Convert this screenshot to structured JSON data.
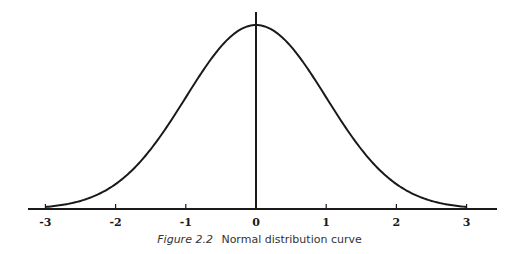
{
  "chart_data": {
    "type": "line",
    "title": "Normal distribution curve",
    "figure_label": "Figure 2.2",
    "xlabel": "",
    "ylabel": "",
    "x_ticks": [
      -3,
      -2,
      -1,
      0,
      1,
      2,
      3
    ],
    "xlim": [
      -3.2,
      3.4
    ],
    "grid": false,
    "legend": null,
    "series": [
      {
        "name": "standard normal pdf",
        "x": [
          -3,
          -2.5,
          -2,
          -1.5,
          -1,
          -0.5,
          0,
          0.5,
          1,
          1.5,
          2,
          2.5,
          3
        ],
        "values": [
          0.0044,
          0.0175,
          0.054,
          0.1295,
          0.242,
          0.3521,
          0.3989,
          0.3521,
          0.242,
          0.1295,
          0.054,
          0.0175,
          0.0044
        ]
      }
    ],
    "annotations": [
      {
        "type": "vertical-line",
        "x": 0,
        "label": "mean"
      }
    ]
  },
  "layout": {
    "baseline_y": 209,
    "peak_y": 25,
    "zero_x": 256,
    "unit_px": 70.2,
    "axis_x0": 28,
    "axis_x1": 497,
    "line_top_y": 12,
    "color": "#1a1a1a"
  },
  "caption": {
    "figure": "Figure 2.2",
    "text": "Normal distribution curve"
  }
}
